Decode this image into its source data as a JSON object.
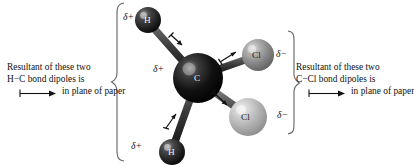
{
  "figure": {
    "molecule_name": "dichloromethane",
    "background_color": "#ffffff"
  },
  "atoms": [
    {
      "id": "h-top",
      "element": "H",
      "label": "H",
      "charge": "δ+",
      "color": "#3a3a3a",
      "cx": 148,
      "cy": 20,
      "r": 13
    },
    {
      "id": "h-bot",
      "element": "H",
      "label": "H",
      "charge": "δ+",
      "color": "#3a3a3a",
      "cx": 172,
      "cy": 152,
      "r": 13
    },
    {
      "id": "c",
      "element": "C",
      "label": "C",
      "charge": "δ+",
      "color": "#0d0d0d",
      "cx": 198,
      "cy": 78,
      "r": 25
    },
    {
      "id": "cl-top",
      "element": "Cl",
      "label": "Cl",
      "charge": "δ−",
      "color": "#8e8e8e",
      "cx": 258,
      "cy": 55,
      "r": 16
    },
    {
      "id": "cl-bot",
      "element": "Cl",
      "label": "Cl",
      "charge": "δ−",
      "color": "#b4b4b4",
      "cx": 248,
      "cy": 117,
      "r": 19
    }
  ],
  "bonds": [
    {
      "id": "bond-h-top-c",
      "from": "h-top",
      "to": "c"
    },
    {
      "id": "bond-h-bot-c",
      "from": "h-bot",
      "to": "c"
    },
    {
      "id": "bond-c-cl-top",
      "from": "c",
      "to": "cl-top"
    },
    {
      "id": "bond-c-cl-bot",
      "from": "c",
      "to": "cl-bot"
    }
  ],
  "bond_dipoles": [
    {
      "id": "dipole-h-top",
      "direction": "H to C, pointing down-right"
    },
    {
      "id": "dipole-h-bot",
      "direction": "H to C, pointing up-right"
    },
    {
      "id": "dipole-cl-top",
      "direction": "C to Cl, pointing up-right"
    },
    {
      "id": "dipole-cl-bot",
      "direction": "C to Cl, pointing down-right"
    }
  ],
  "braces": {
    "left": {
      "id": "brace-left",
      "orientation": "points-left"
    },
    "right": {
      "id": "brace-right",
      "orientation": "points-right"
    }
  },
  "annotations": {
    "left": {
      "line1": "Resultant of these two",
      "line2": "H−C bond dipoles is",
      "line3": "in plane of paper",
      "arrow_direction": "right"
    },
    "right": {
      "line1": "Resultant of these two",
      "line2": "C−Cl bond dipoles is",
      "line3": "in plane of paper",
      "arrow_direction": "right"
    }
  }
}
